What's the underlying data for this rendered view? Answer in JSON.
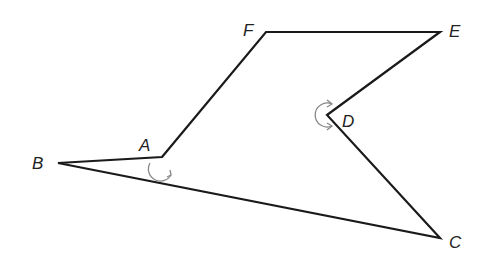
{
  "diagram": {
    "type": "polygon",
    "stroke_color": "#1a1a1a",
    "arc_color": "#888888",
    "vertices": [
      {
        "name": "A",
        "x": 162,
        "y": 157,
        "label_x": 139,
        "label_y": 137
      },
      {
        "name": "B",
        "x": 58,
        "y": 163,
        "label_x": 32,
        "label_y": 155
      },
      {
        "name": "C",
        "x": 440,
        "y": 238,
        "label_x": 449,
        "label_y": 234
      },
      {
        "name": "D",
        "x": 327,
        "y": 115,
        "label_x": 342,
        "label_y": 113
      },
      {
        "name": "E",
        "x": 440,
        "y": 32,
        "label_x": 449,
        "label_y": 23
      },
      {
        "name": "F",
        "x": 266,
        "y": 32,
        "label_x": 243,
        "label_y": 22
      }
    ],
    "edges": [
      [
        "A",
        "F"
      ],
      [
        "F",
        "E"
      ],
      [
        "E",
        "D"
      ],
      [
        "D",
        "C"
      ],
      [
        "C",
        "B"
      ],
      [
        "B",
        "A"
      ]
    ],
    "angle_markers": [
      {
        "vertex": "A",
        "kind": "reflex-arc-with-arrow"
      },
      {
        "vertex": "D",
        "kind": "reflex-arc-with-arrow"
      }
    ]
  }
}
